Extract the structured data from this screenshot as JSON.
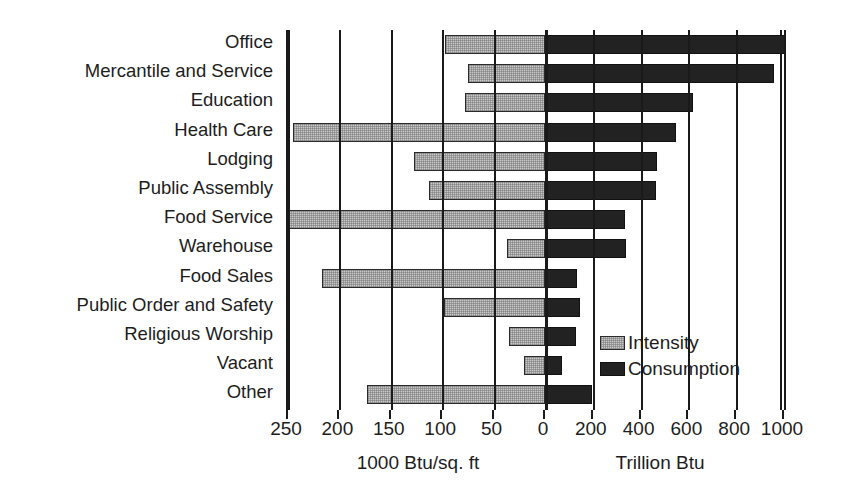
{
  "chart_data": {
    "type": "bar",
    "orientation": "horizontal",
    "layout": "diverging-dual-axis",
    "title": "",
    "subtitle": "",
    "categories": [
      "Office",
      "Mercantile and Service",
      "Education",
      "Health Care",
      "Lodging",
      "Public Assembly",
      "Food Service",
      "Warehouse",
      "Food Sales",
      "Public Order and Safety",
      "Religious Worship",
      "Vacant",
      "Other"
    ],
    "series": [
      {
        "name": "Intensity",
        "units": "1000 Btu/sq. ft",
        "direction": "left",
        "color": "#c9c9c9",
        "values": [
          97,
          75,
          78,
          245,
          127,
          113,
          250,
          37,
          217,
          98,
          35,
          20,
          173
        ]
      },
      {
        "name": "Consumption",
        "units": "Trillion Btu",
        "direction": "right",
        "color": "#222222",
        "values": [
          1005,
          960,
          620,
          550,
          470,
          465,
          335,
          340,
          135,
          145,
          130,
          70,
          195
        ]
      }
    ],
    "left_axis": {
      "label": "1000 Btu/sq. ft",
      "ticks": [
        250,
        200,
        150,
        100,
        50,
        0
      ],
      "min": 0,
      "max": 250,
      "direction": "right-to-left"
    },
    "right_axis": {
      "label": "Trillion Btu",
      "ticks": [
        0,
        200,
        400,
        600,
        800,
        1000
      ],
      "min": 0,
      "max": 1000,
      "direction": "left-to-right"
    },
    "tick_labels": [
      "250",
      "200",
      "150",
      "100",
      "50",
      "0",
      "200",
      "400",
      "600",
      "800",
      "1000"
    ],
    "legend": {
      "position": "inside-right-lower",
      "entries": [
        {
          "label": "Intensity",
          "swatch": "light-gray-hatched"
        },
        {
          "label": "Consumption",
          "swatch": "solid-black"
        }
      ]
    },
    "grid": true,
    "grid_orientation": "vertical"
  }
}
